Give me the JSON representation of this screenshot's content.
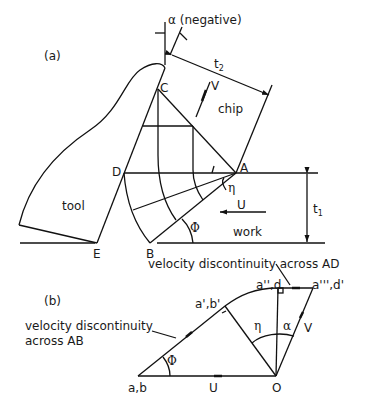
{
  "figure": {
    "part_a": {
      "label": "(a)",
      "alpha_label": "α (negative)",
      "t2_label": "t",
      "t2_sub": "2",
      "t1_label": "t",
      "t1_sub": "1",
      "v_label": "V",
      "chip_label": "chip",
      "tool_label": "tool",
      "work_label": "work",
      "u_label": "U",
      "eta_label": "η",
      "phi_label": "Φ",
      "points": {
        "A": "A",
        "B": "B",
        "C": "C",
        "D": "D",
        "E": "E"
      }
    },
    "part_b": {
      "label": "(b)",
      "annotation_ad": "velocity discontinuity across AD",
      "annotation_ab_line1": "velocity discontinuity",
      "annotation_ab_line2": "across AB",
      "points": {
        "ab": "a,b",
        "o": "O",
        "a1b1": "a',b'",
        "a2d": "a'',d",
        "a3d1": "a''',d'"
      },
      "u_label": "U",
      "v_label": "V",
      "eta_label": "η",
      "alpha_label": "α",
      "phi_label": "Φ"
    }
  }
}
